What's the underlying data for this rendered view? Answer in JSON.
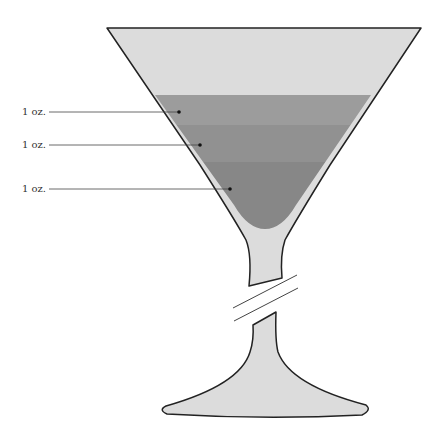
{
  "diagram": {
    "layers": [
      {
        "label": "1 oz.",
        "color": "#9a9a9a"
      },
      {
        "label": "1 oz.",
        "color": "#8f8f8f"
      },
      {
        "label": "1 oz.",
        "color": "#868686"
      }
    ],
    "colors": {
      "glass_fill": "#dcdcdc",
      "outline": "#222222",
      "leader_line": "#444444"
    },
    "stem_break": "double slash indicating shortened stem"
  }
}
